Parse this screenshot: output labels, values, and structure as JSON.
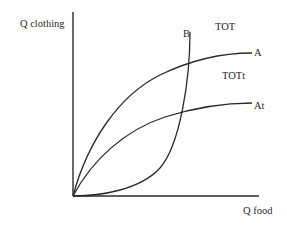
{
  "diagram": {
    "axes": {
      "y_label": "Q clothing",
      "x_label": "Q food"
    },
    "curves": [
      {
        "id": "A",
        "label": "A",
        "description": "offer curve rising from origin, concave"
      },
      {
        "id": "At",
        "label": "At",
        "description": "lower offer curve rising from origin, concave"
      },
      {
        "id": "B",
        "label": "B",
        "description": "offer curve rising from origin, convex, steep"
      }
    ],
    "annotations": {
      "tot": "TOT",
      "tott": "TOTt"
    },
    "colors": {
      "line": "#2a2a2a",
      "background": "#ffffff"
    }
  }
}
